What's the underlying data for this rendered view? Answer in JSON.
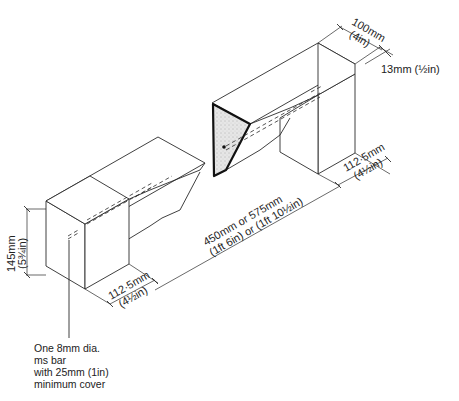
{
  "diagram": {
    "type": "isometric construction detail",
    "dimensions": {
      "top_width": {
        "metric": "100mm",
        "imperial": "(4in)"
      },
      "top_offset": {
        "metric": "13mm",
        "imperial": "(½in)",
        "label": "13mm (½in)"
      },
      "right_bearing": {
        "metric": "112·5mm",
        "imperial": "(4½in)"
      },
      "span": {
        "metric": "450mm or 575mm",
        "imperial": "(1ft 6in) or (1ft 10½in)"
      },
      "left_bearing": {
        "metric": "112·5mm",
        "imperial": "(4½in)"
      },
      "height": {
        "metric": "145mm",
        "imperial": "(5¾in)"
      }
    },
    "note": {
      "lines": [
        "One 8mm dia.",
        "ms bar",
        "with 25mm (1in)",
        "minimum cover"
      ]
    },
    "colors": {
      "line": "#2a2a2a",
      "section_fill": "#d8d8d8",
      "background": "#ffffff"
    }
  }
}
